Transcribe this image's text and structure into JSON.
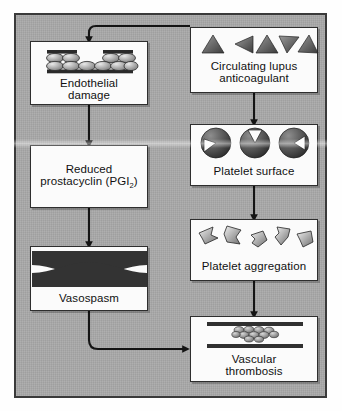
{
  "diagram": {
    "panel_color": "#a8a8a8",
    "node_fill": "#fbfbfb",
    "ink": "#2e2e2e"
  },
  "nodes": {
    "endothelial_damage": {
      "label_line1": "Endothelial",
      "label_line2": "damage",
      "icon": "endothelial-cell-layer-icon"
    },
    "reduced_prostacyclin": {
      "label_line1": "Reduced",
      "label_line2_pre": "prostacyclin (PGI",
      "label_line2_sub": "2",
      "label_line2_post": ")"
    },
    "vasospasm": {
      "label": "Vasospasm",
      "icon": "constricted-vessel-icon"
    },
    "circulating_lupus_anticoagulant": {
      "label_line1": "Circulating lupus",
      "label_line2": "anticoagulant",
      "icon": "antibody-triangles-icon",
      "shape_count": 5
    },
    "platelet_surface": {
      "label": "Platelet surface",
      "icon": "platelet-receptor-spheres-icon",
      "shape_count": 3
    },
    "platelet_aggregation": {
      "label": "Platelet aggregation",
      "icon": "activated-platelets-icon",
      "shape_count": 5
    },
    "vascular_thrombosis": {
      "label_line1": "Vascular",
      "label_line2": "thrombosis",
      "icon": "vessel-with-thrombus-icon"
    }
  },
  "edges": [
    {
      "name": "lupus-to-endothelial-damage",
      "from": "circulating_lupus_anticoagulant",
      "to": "endothelial_damage",
      "style": "elbow"
    },
    {
      "name": "endothelial-to-prostacyclin",
      "from": "endothelial_damage",
      "to": "reduced_prostacyclin",
      "style": "straight"
    },
    {
      "name": "prostacyclin-to-vasospasm",
      "from": "reduced_prostacyclin",
      "to": "vasospasm",
      "style": "straight"
    },
    {
      "name": "vasospasm-to-thrombosis",
      "from": "vasospasm",
      "to": "vascular_thrombosis",
      "style": "elbow"
    },
    {
      "name": "lupus-to-platelet-surface",
      "from": "circulating_lupus_anticoagulant",
      "to": "platelet_surface",
      "style": "straight"
    },
    {
      "name": "platelet-surface-to-aggregation",
      "from": "platelet_surface",
      "to": "platelet_aggregation",
      "style": "straight"
    },
    {
      "name": "aggregation-to-thrombosis",
      "from": "platelet_aggregation",
      "to": "vascular_thrombosis",
      "style": "straight"
    }
  ]
}
